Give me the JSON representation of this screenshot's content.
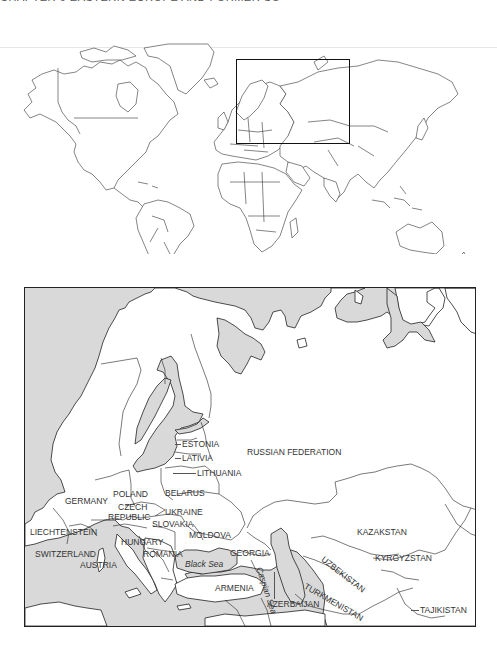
{
  "page": {
    "header_text": "CHAPTER 6 EASTERN EUROPE AND FORMER SOVIET REPUBLICS",
    "background": "#ffffff"
  },
  "world_map": {
    "description": "World locator map with outline of countries",
    "inset_box": {
      "x": 236,
      "y": 59,
      "width": 114,
      "height": 85
    },
    "land_color": "#ffffff",
    "border_color": "#222222"
  },
  "region_map": {
    "sea_color": "#d9d9d9",
    "land_color": "#ffffff",
    "labels": {
      "estonia": "ESTONIA",
      "latvia": "LATIVIA",
      "lithuania": "LITHUANIA",
      "russia": "RUSSIAN FEDERATION",
      "belarus": "BELARUS",
      "poland": "POLAND",
      "germany": "GERMANY",
      "czech_1": "CZECH",
      "czech_2": "REPUBLIC",
      "ukraine": "UKRAINE",
      "slovakia": "SLOVAKIA",
      "moldova": "MOLDOVA",
      "liechtenstein": "LIECHTENSTEIN",
      "hungary": "HUNGARY",
      "romania": "ROMANIA",
      "switzerland": "SWITZERLAND",
      "austria": "AUSTRIA",
      "georgia": "GEORGIA",
      "armenia": "ARMENIA",
      "azerbaijan": "AZERBAIJAN",
      "kazakhstan": "KAZAKSTAN",
      "kyrgyzstan": "KYRGYZSTAN",
      "uzbekistan": "UZBEKISTAN",
      "turkmenistan": "TURKMENISTAN",
      "tajikistan": "TAJIKISTAN",
      "black_sea": "Black Sea",
      "caspian_sea": "Caspian Sea"
    }
  }
}
